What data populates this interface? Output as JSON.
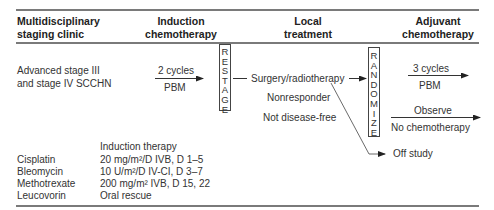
{
  "headers": {
    "col1": [
      "Multidisciplinary",
      "staging clinic"
    ],
    "col2": [
      "Induction",
      "chemotherapy"
    ],
    "col3": [
      "Local",
      "treatment"
    ],
    "col4": [
      "Adjuvant",
      "chemotherapy"
    ]
  },
  "population": [
    "Advanced stage III",
    "and stage IV SCCHN"
  ],
  "induction_arrow": {
    "above": "2 cycles",
    "below": "PBM"
  },
  "restage_box": [
    "R",
    "E",
    "S",
    "T",
    "A",
    "G",
    "E"
  ],
  "local": {
    "surgery": "Surgery/radiotherapy",
    "nonresponder": "Nonresponder",
    "not_disease_free": "Not disease-free"
  },
  "randomize_box": [
    "R",
    "A",
    "N",
    "D",
    "O",
    "M",
    "I",
    "Z",
    "E"
  ],
  "adjuvant": {
    "arm1_above": "3 cycles",
    "arm1_below": "PBM",
    "arm2_above": "Observe",
    "arm2_below": "No chemotherapy",
    "off_study": "Off study"
  },
  "regimen": {
    "title": "Induction therapy",
    "drugs": [
      {
        "name": "Cisplatin",
        "dose": "20 mg/m²/D IVB, D 1–5"
      },
      {
        "name": "Bleomycin",
        "dose": "10 U/m²/D IV-CI, D 3–7"
      },
      {
        "name": "Methotrexate",
        "dose": "200 mg/m² IVB, D 15, 22"
      },
      {
        "name": "Leucovorin",
        "dose": "Oral rescue"
      }
    ]
  }
}
